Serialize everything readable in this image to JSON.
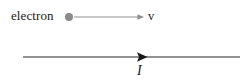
{
  "figure": {
    "background_color": "#ffffff"
  },
  "electron": {
    "label": "electron",
    "particle_icon": "filled-circle-icon",
    "particle_color": "#8a8a8a",
    "particle_center_x": 69,
    "particle_center_y": 17,
    "particle_radius": 4
  },
  "velocity_arrow": {
    "label": "v",
    "color": "#8f8f8f",
    "x_start": 74,
    "x_end": 144,
    "y": 17,
    "arrowhead": "right-arrowhead-icon",
    "stroke_width": 1
  },
  "current_line": {
    "label": "I",
    "color": "#262626",
    "x_start": 23,
    "x_end": 240,
    "y": 57,
    "stroke_width": 1.1,
    "arrowhead": "right-arrowhead-icon",
    "arrowhead_x": 147,
    "arrowhead_half_height": 4.5
  }
}
